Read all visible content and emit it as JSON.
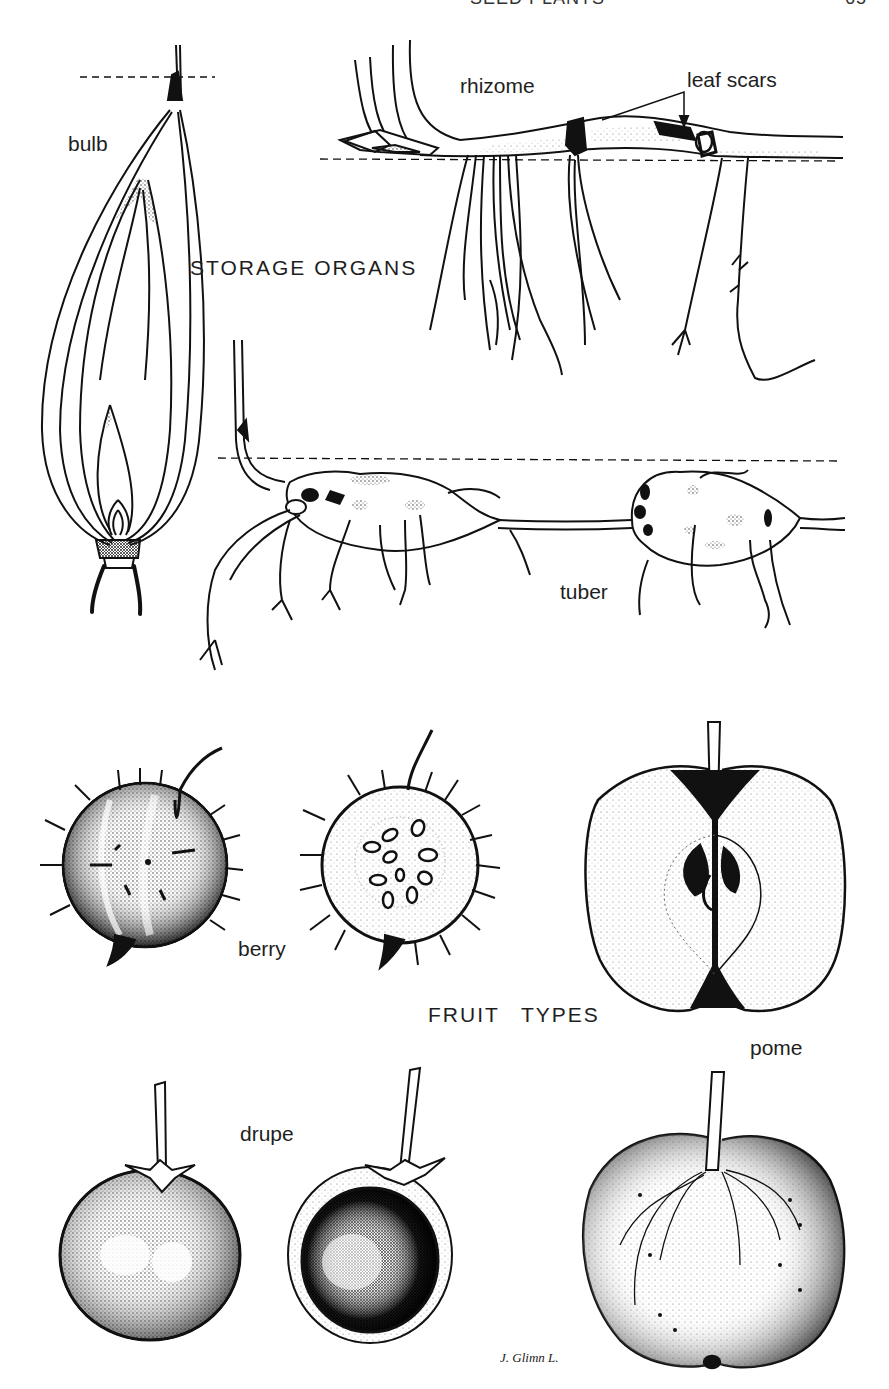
{
  "page": {
    "running_header": "SEED PLANTS",
    "page_number": "65"
  },
  "sections": {
    "storage_organs": {
      "title": "STORAGE ORGANS",
      "labels": {
        "bulb": "bulb",
        "rhizome": "rhizome",
        "leaf_scars": "leaf scars",
        "tuber": "tuber"
      }
    },
    "fruit_types": {
      "title": "FRUIT TYPES",
      "labels": {
        "berry": "berry",
        "pome": "pome",
        "drupe": "drupe"
      }
    }
  },
  "signature": "J. Glimn L.",
  "colors": {
    "ink": "#111111",
    "paper": "#ffffff",
    "stipple": "#555555"
  }
}
